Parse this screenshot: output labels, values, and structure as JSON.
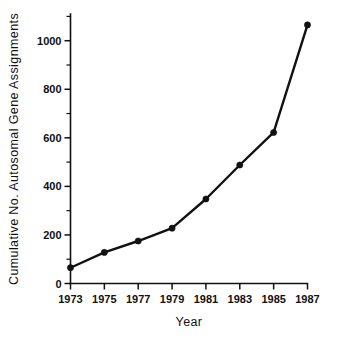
{
  "chart_data": {
    "type": "line",
    "title": "",
    "xlabel": "Year",
    "ylabel": "Cumulative  No.  Autosomal  Gene  Assignments",
    "x": [
      1973,
      1975,
      1977,
      1979,
      1981,
      1983,
      1985,
      1987
    ],
    "values": [
      65,
      128,
      175,
      228,
      348,
      488,
      622,
      1065
    ],
    "series": [
      {
        "name": "Cumulative autosomal gene assignments",
        "values": [
          65,
          128,
          175,
          228,
          348,
          488,
          622,
          1065
        ]
      }
    ],
    "xtick_labels": [
      "1973",
      "1975",
      "1977",
      "1979",
      "1981",
      "1983",
      "1985",
      "1987"
    ],
    "ytick_labels": [
      "0",
      "200",
      "400",
      "600",
      "800",
      "1000"
    ],
    "yticks": [
      0,
      200,
      400,
      600,
      800,
      1000
    ],
    "yminor_step": 100,
    "xlim": [
      1973,
      1987
    ],
    "ylim": [
      0,
      1110
    ],
    "grid": false,
    "legend": false,
    "marker": "filled-circle",
    "line_color": "#111111",
    "marker_color": "#111111",
    "background_color": "#ffffff"
  },
  "axes": {
    "x_axis_name": "Year",
    "y_axis_name": "Cumulative  No.  Autosomal  Gene  Assignments"
  }
}
